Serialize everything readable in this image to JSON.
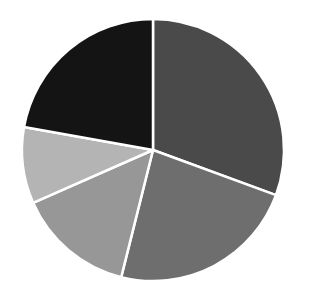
{
  "chart_data": {
    "type": "pie",
    "title": "",
    "xlabel": "",
    "ylabel": "",
    "legend": "none",
    "start_angle_deg": 0,
    "direction": "clockwise",
    "categories": [
      "Slice 1",
      "Slice 2",
      "Slice 3",
      "Slice 4",
      "Slice 5"
    ],
    "values": [
      30.6,
      23.3,
      14.5,
      9.4,
      22.2
    ],
    "colors": [
      "#4a4a4a",
      "#6e6e6e",
      "#979797",
      "#b4b4b4",
      "#141414"
    ],
    "separator_color": "#ffffff",
    "center": [
      153,
      150
    ],
    "radius": 131
  }
}
